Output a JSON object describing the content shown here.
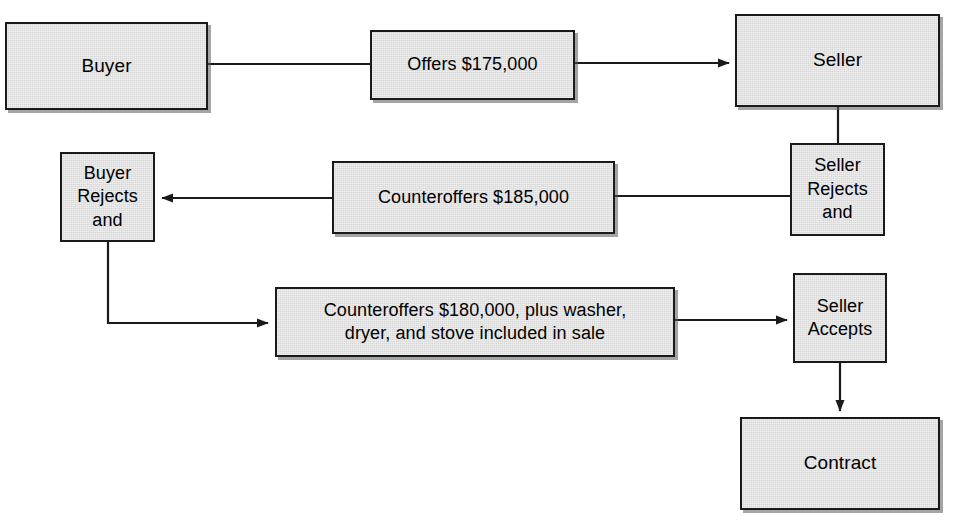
{
  "diagram": {
    "type": "flowchart",
    "canvas": {
      "width": 956,
      "height": 523
    },
    "style": {
      "box_fill": "#d8d8d8",
      "box_border": "#1a1a1a",
      "text_color": "#000000",
      "line_color": "#1a1a1a",
      "page_background": "#ffffff"
    },
    "nodes": [
      {
        "id": "buyer",
        "label": "Buyer"
      },
      {
        "id": "offer",
        "label": "Offers $175,000"
      },
      {
        "id": "seller",
        "label": "Seller"
      },
      {
        "id": "seller-rejects",
        "label": "Seller\nRejects\nand"
      },
      {
        "id": "counteroffer-185",
        "label": "Counteroffers $185,000"
      },
      {
        "id": "buyer-rejects",
        "label": "Buyer\nRejects\nand"
      },
      {
        "id": "counteroffer-180",
        "label": "Counteroffers $180,000, plus washer,\ndryer, and stove included in sale"
      },
      {
        "id": "seller-accepts",
        "label": "Seller\nAccepts"
      },
      {
        "id": "contract",
        "label": "Contract"
      }
    ],
    "edges": [
      {
        "id": "buyer-to-offer",
        "from": "buyer",
        "to": "offer",
        "arrow": false,
        "direction": "right"
      },
      {
        "id": "offer-to-seller",
        "from": "offer",
        "to": "seller",
        "arrow": true,
        "direction": "right"
      },
      {
        "id": "seller-to-seller-rejects",
        "from": "seller",
        "to": "seller-rejects",
        "arrow": false,
        "direction": "down"
      },
      {
        "id": "seller-rejects-to-counter-185",
        "from": "seller-rejects",
        "to": "counteroffer-185",
        "arrow": false,
        "direction": "left"
      },
      {
        "id": "counter-185-to-buyer-rejects",
        "from": "counteroffer-185",
        "to": "buyer-rejects",
        "arrow": true,
        "direction": "left"
      },
      {
        "id": "buyer-rejects-to-counter-180",
        "from": "buyer-rejects",
        "to": "counteroffer-180",
        "arrow": true,
        "direction": "down-right"
      },
      {
        "id": "counter-180-to-seller-accepts",
        "from": "counteroffer-180",
        "to": "seller-accepts",
        "arrow": true,
        "direction": "right"
      },
      {
        "id": "seller-accepts-to-contract",
        "from": "seller-accepts",
        "to": "contract",
        "arrow": true,
        "direction": "down"
      }
    ]
  }
}
